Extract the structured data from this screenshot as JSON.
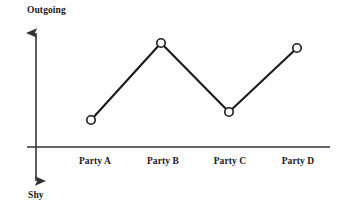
{
  "chart_data": {
    "type": "line",
    "title": "",
    "subtitle": "",
    "xlabel": "",
    "ylabel": "",
    "categories": [
      "Party A",
      "Party B",
      "Party C",
      "Party D"
    ],
    "series": [
      {
        "name": "Sociability",
        "values": [
          1.0,
          4.0,
          1.4,
          3.75
        ]
      }
    ],
    "axis_captions": {
      "y_top": "Outgoing",
      "y_bottom": "Shy"
    },
    "ylim": [
      -2.0,
      5.2
    ],
    "xlim": [
      0,
      5
    ],
    "grid": false,
    "legend": "none",
    "marker": "open-circle",
    "annotations": []
  },
  "style": {
    "background": "#fefefe",
    "line_color": "#1a1a1a",
    "axis_color": "#333333",
    "marker_fill": "#ffffff",
    "marker_stroke": "#1a1a1a",
    "text_color": "#1a1a1a"
  },
  "geometry": {
    "axis_x_start": 27,
    "axis_x_end": 330,
    "axis_y": 147,
    "axis_v_x": 36,
    "axis_v_top": 28,
    "axis_v_bottom": 186,
    "points": [
      {
        "cx": 91,
        "cy": 120,
        "label_x": 95
      },
      {
        "cx": 161,
        "cy": 43,
        "label_x": 163
      },
      {
        "cx": 229,
        "cy": 112,
        "label_x": 230
      },
      {
        "cx": 297,
        "cy": 48,
        "label_x": 298
      }
    ],
    "tick_label_y": 157,
    "marker_radius": 4.2
  }
}
